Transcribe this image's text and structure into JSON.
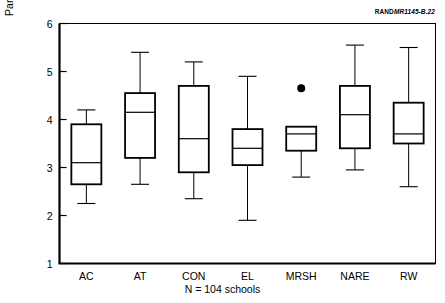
{
  "figure": {
    "source_id_brand": "RAND",
    "source_id_code": "MR1145-B.22"
  },
  "chart_data": {
    "type": "box",
    "title": "",
    "xlabel": "N = 104 schools",
    "ylabel": "Parents and community are involved",
    "ylim": [
      1,
      6
    ],
    "ytick_labels": [
      "1",
      "2",
      "3",
      "4",
      "5",
      "6"
    ],
    "yticks": [
      1,
      2,
      3,
      4,
      5,
      6
    ],
    "grid": false,
    "legend": "none",
    "categories": [
      "AC",
      "AT",
      "CON",
      "EL",
      "MRSH",
      "NARE",
      "RW"
    ],
    "boxes": [
      {
        "category": "AC",
        "whisker_low": 2.25,
        "q1": 2.65,
        "median": 3.1,
        "q3": 3.9,
        "whisker_high": 4.2,
        "outliers": []
      },
      {
        "category": "AT",
        "whisker_low": 2.65,
        "q1": 3.2,
        "median": 4.15,
        "q3": 4.55,
        "whisker_high": 5.4,
        "outliers": []
      },
      {
        "category": "CON",
        "whisker_low": 2.35,
        "q1": 2.9,
        "median": 3.6,
        "q3": 4.7,
        "whisker_high": 5.2,
        "outliers": []
      },
      {
        "category": "EL",
        "whisker_low": 1.9,
        "q1": 3.05,
        "median": 3.4,
        "q3": 3.8,
        "whisker_high": 4.9,
        "outliers": []
      },
      {
        "category": "MRSH",
        "whisker_low": 2.8,
        "q1": 3.35,
        "median": 3.7,
        "q3": 3.85,
        "whisker_high": 3.85,
        "outliers": [
          4.65
        ]
      },
      {
        "category": "NARE",
        "whisker_low": 2.95,
        "q1": 3.4,
        "median": 4.1,
        "q3": 4.7,
        "whisker_high": 5.55,
        "outliers": []
      },
      {
        "category": "RW",
        "whisker_low": 2.6,
        "q1": 3.5,
        "median": 3.7,
        "q3": 4.35,
        "whisker_high": 5.5,
        "outliers": []
      }
    ]
  }
}
